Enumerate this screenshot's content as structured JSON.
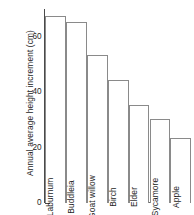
{
  "chart_data": {
    "type": "bar",
    "title": "",
    "subtitle": "",
    "xlabel": "",
    "ylabel": "Annual average height increment (cm)",
    "categories": [
      "Laburnum",
      "Buddleia",
      "Goat willow",
      "Birch",
      "Elder",
      "Sycamore",
      "Apple"
    ],
    "values": [
      67,
      65,
      53,
      44,
      35,
      30,
      23
    ],
    "ylim": [
      0,
      70
    ],
    "yticks_major": [
      0,
      20,
      40,
      60
    ],
    "yticks_minor": [
      10,
      30,
      50,
      70
    ],
    "ytick_labels": [
      "0",
      "20",
      "40",
      "60"
    ],
    "grid": false,
    "legend": false,
    "legend_position": "none",
    "annotations": [],
    "colors": {
      "bar_fill": "#ffffff",
      "bar_stroke": "#8a8a8a",
      "axis": "#4a4a4a",
      "text": "#1d1d1d",
      "background": "#ffffff"
    }
  },
  "axis": {
    "y_title": "Annual average height increment (cm)",
    "ticks": [
      {
        "label": "60",
        "value": 60,
        "major": true
      },
      {
        "label": "",
        "value": 50,
        "major": false
      },
      {
        "label": "40",
        "value": 40,
        "major": true
      },
      {
        "label": "",
        "value": 30,
        "major": false
      },
      {
        "label": "20",
        "value": 20,
        "major": true
      },
      {
        "label": "",
        "value": 10,
        "major": false
      },
      {
        "label": "0",
        "value": 0,
        "major": true
      }
    ]
  },
  "bars": [
    {
      "label": "Laburnum",
      "value": 67
    },
    {
      "label": "Buddleia",
      "value": 65
    },
    {
      "label": "Goat willow",
      "value": 53
    },
    {
      "label": "Birch",
      "value": 44
    },
    {
      "label": "Elder",
      "value": 35
    },
    {
      "label": "Sycamore",
      "value": 30
    },
    {
      "label": "Apple",
      "value": 23
    }
  ]
}
